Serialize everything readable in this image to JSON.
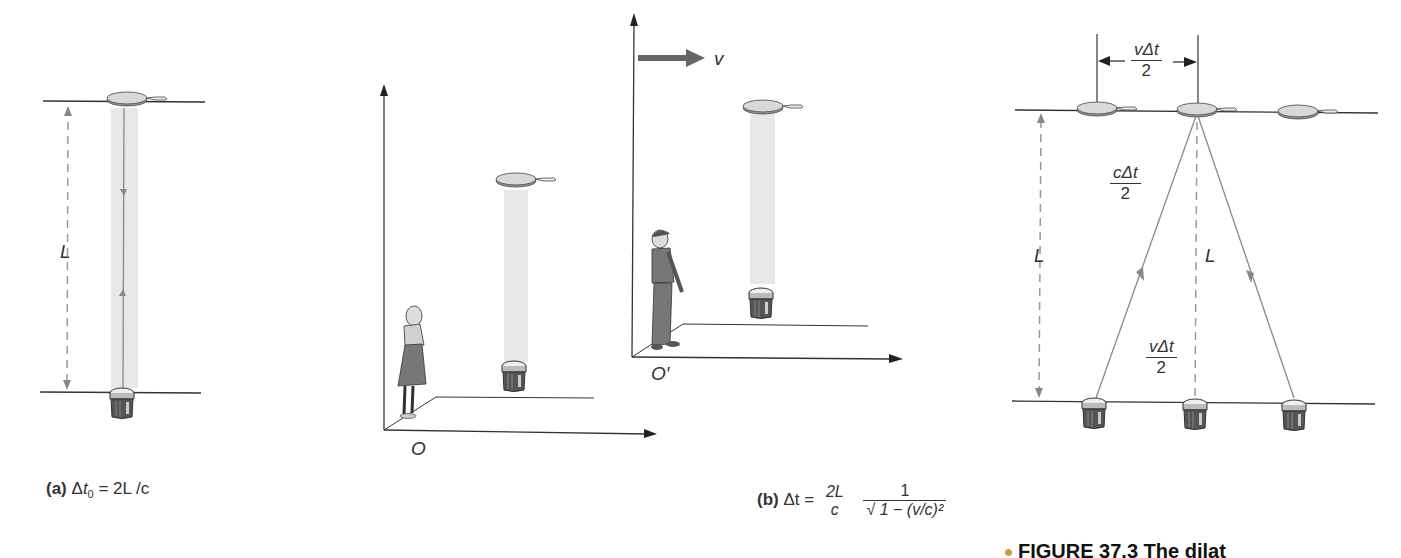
{
  "panel_a": {
    "caption_prefix": "(a)",
    "caption_equation": "Δt₀ = 2L/c",
    "caption_delta": "Δ",
    "caption_t": "t",
    "caption_sub": "0",
    "caption_rest": " = 2L /c",
    "length_label": "L"
  },
  "panel_b": {
    "caption_prefix": "(b)",
    "caption_lhs": "Δt =",
    "frac1_num": "2L",
    "frac1_den": "c",
    "frac2_num": "1",
    "frac2_den": "√ 1 − (v/c)²",
    "observer_o_label": "O",
    "observer_o_prime_label": "O′",
    "velocity_label": "v",
    "top_dim_num": "vΔt",
    "top_dim_den": "2",
    "hyp_num": "cΔt",
    "hyp_den": "2",
    "left_L_label": "L",
    "center_L_label": "L",
    "bottom_dim_num": "vΔt",
    "bottom_dim_den": "2"
  },
  "figure_caption": "FIGURE 37.3 The dilat",
  "colors": {
    "line": "#333333",
    "gray_line": "#888888",
    "light_beam": "#e8e8e8",
    "arrow_velocity": "#666666",
    "mirror_fill": "#d9d9d9",
    "flashlight": "#555555"
  }
}
